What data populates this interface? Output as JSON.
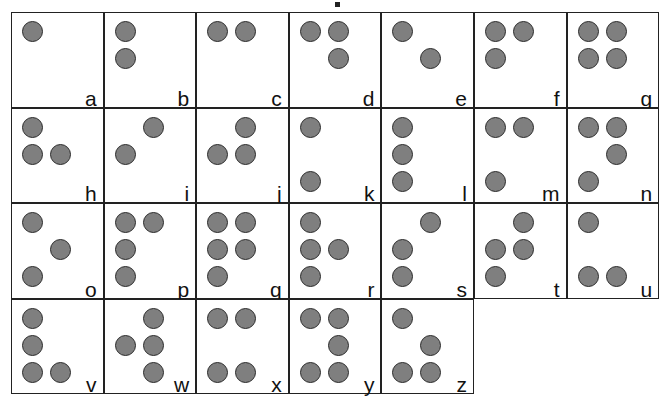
{
  "colors": {
    "dot_fill": "#7f7f7f",
    "dot_stroke": "#2b2b2b",
    "border": "#222222"
  },
  "cells": [
    {
      "letter": "a",
      "dots": [
        1
      ]
    },
    {
      "letter": "b",
      "dots": [
        1,
        2
      ]
    },
    {
      "letter": "c",
      "dots": [
        1,
        4
      ]
    },
    {
      "letter": "d",
      "dots": [
        1,
        4,
        5
      ]
    },
    {
      "letter": "e",
      "dots": [
        1,
        5
      ]
    },
    {
      "letter": "f",
      "dots": [
        1,
        2,
        4
      ]
    },
    {
      "letter": "g",
      "dots": [
        1,
        2,
        4,
        5
      ]
    },
    {
      "letter": "h",
      "dots": [
        1,
        2,
        5
      ]
    },
    {
      "letter": "i",
      "dots": [
        2,
        4
      ]
    },
    {
      "letter": "j",
      "dots": [
        2,
        4,
        5
      ]
    },
    {
      "letter": "k",
      "dots": [
        1,
        3
      ]
    },
    {
      "letter": "l",
      "dots": [
        1,
        2,
        3
      ]
    },
    {
      "letter": "m",
      "dots": [
        1,
        3,
        4
      ]
    },
    {
      "letter": "n",
      "dots": [
        1,
        3,
        4,
        5
      ]
    },
    {
      "letter": "o",
      "dots": [
        1,
        3,
        5
      ]
    },
    {
      "letter": "p",
      "dots": [
        1,
        2,
        3,
        4
      ]
    },
    {
      "letter": "q",
      "dots": [
        1,
        2,
        3,
        4,
        5
      ]
    },
    {
      "letter": "r",
      "dots": [
        1,
        2,
        3,
        5
      ]
    },
    {
      "letter": "s",
      "dots": [
        2,
        3,
        4
      ]
    },
    {
      "letter": "t",
      "dots": [
        2,
        3,
        4,
        5
      ]
    },
    {
      "letter": "u",
      "dots": [
        1,
        3,
        6
      ]
    },
    {
      "letter": "v",
      "dots": [
        1,
        2,
        3,
        6
      ]
    },
    {
      "letter": "w",
      "dots": [
        2,
        4,
        5,
        6
      ]
    },
    {
      "letter": "x",
      "dots": [
        1,
        3,
        4,
        6
      ]
    },
    {
      "letter": "y",
      "dots": [
        1,
        3,
        4,
        5,
        6
      ]
    },
    {
      "letter": "z",
      "dots": [
        1,
        3,
        5,
        6
      ]
    }
  ]
}
